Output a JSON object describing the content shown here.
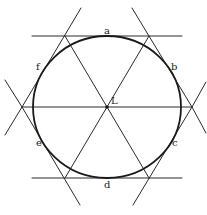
{
  "diagram": {
    "type": "geometric-construction",
    "colors": {
      "stroke": "#2a2a2a",
      "circle": "#1a1a1a",
      "background": "#ffffff"
    },
    "center": {
      "label": "L",
      "x": 107,
      "y": 107
    },
    "circle": {
      "cx": 107,
      "cy": 107,
      "rx": 74,
      "ry": 71
    },
    "tangent_points": [
      {
        "label": "a",
        "x": 107,
        "y": 36
      },
      {
        "label": "b",
        "x": 170,
        "y": 70
      },
      {
        "label": "c",
        "x": 170,
        "y": 144
      },
      {
        "label": "d",
        "x": 107,
        "y": 178
      },
      {
        "label": "e",
        "x": 38,
        "y": 144
      },
      {
        "label": "f",
        "x": 38,
        "y": 70
      }
    ],
    "hexagon_vertices": [
      {
        "x": 65,
        "y": 36
      },
      {
        "x": 149,
        "y": 36
      },
      {
        "x": 192,
        "y": 107
      },
      {
        "x": 149,
        "y": 178
      },
      {
        "x": 65,
        "y": 178
      },
      {
        "x": 22,
        "y": 107
      }
    ],
    "labels": {
      "a": "a",
      "b": "b",
      "c": "c",
      "d": "d",
      "e": "e",
      "f": "f",
      "L": "L"
    }
  }
}
